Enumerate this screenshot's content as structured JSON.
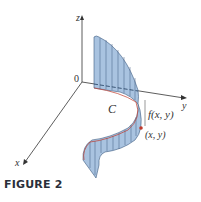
{
  "figure": {
    "caption": "FIGURE 2",
    "axes": {
      "z_label": "z",
      "y_label": "y",
      "x_label": "x",
      "origin_label": "0"
    },
    "curve_label": "C",
    "height_label": "f(x, y)",
    "point_label": "(x, y)",
    "colors": {
      "surface_fill": "#a9c3e0",
      "surface_edge": "#3d5a80",
      "curve": "#c0392b",
      "axis": "#333333",
      "point": "#c0392b"
    }
  }
}
